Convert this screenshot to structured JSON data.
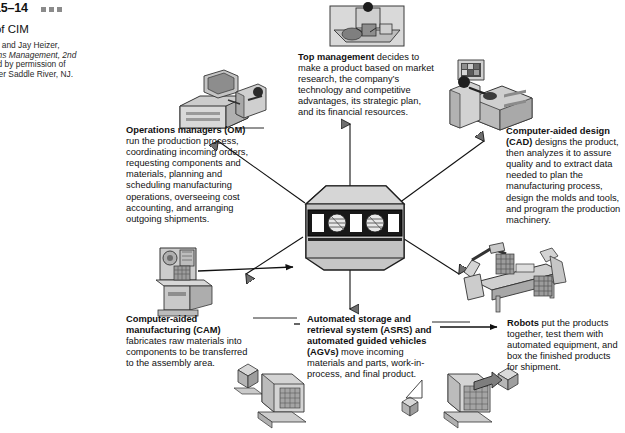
{
  "header": {
    "figure_number": "15–14",
    "caption": "s of CIM",
    "credit_line_1": "Render and Jay Heizer,",
    "credit_line_2": "perations Management, 2nd",
    "credit_line_3": "eprinted by permission of",
    "credit_line_4": "c., Upper Saddle River, NJ.",
    "marks_count": 3
  },
  "nodes": {
    "top_management": {
      "term": "Top management",
      "body": " decides to make a product based on market research, the company’s technology and competitive advantages, its strategic plan, and its financial resources.",
      "icon": "executive-at-desk-illustration"
    },
    "operations_managers": {
      "term": "Operations managers (OM)",
      "body": " run the production process, coordinating incoming orders, requesting components and materials, planning and scheduling manufacturing operations, overseeing cost accounting, and arranging outgoing shipments.",
      "icon": "office-workstation-illustration"
    },
    "computer_aided_design": {
      "term": "Computer-aided design (CAD)",
      "body": " designs the product, then analyzes it to assure quality and to extract data needed to plan the manufacturing process, design the molds and tools, and program the production machinery.",
      "icon": "cad-workstation-illustration"
    },
    "computer_aided_manufacturing": {
      "term": "Computer-aided manufacturing (CAM)",
      "body": " fabricates raw materials into components to be transferred to the assembly area.",
      "icon": "cnc-machine-illustration"
    },
    "asrs_agv": {
      "term": "Automated storage and retrieval system (ASRS) and automated guided vehicles (AGVs)",
      "body": " move incoming materials and parts, work-in-process, and final product.",
      "icon": "automated-storage-vehicle-illustration"
    },
    "robots": {
      "term": "Robots",
      "body": " put the products together, test them with automated equipment, and box the finished products for shipment.",
      "icon": "robotic-assembly-line-illustration"
    }
  },
  "hub": {
    "name": "central-cim-computer",
    "label": "",
    "screen_elements": 5
  },
  "colors": {
    "text": "#111111",
    "line": "#000000",
    "mark": "#8b8b8b",
    "art_fill_light": "#d9d9d9",
    "art_fill_mid": "#b3b3b3",
    "art_fill_dark": "#7a7a7a",
    "hub_dark": "#1d1d1d",
    "page_bg": "#ffffff"
  }
}
